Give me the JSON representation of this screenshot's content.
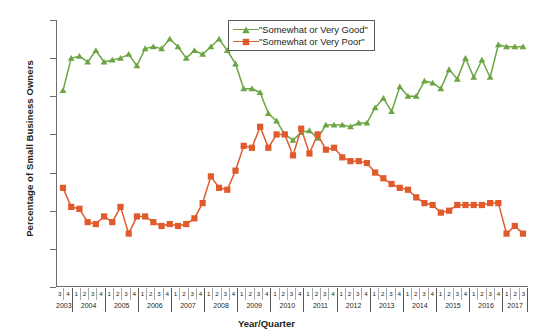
{
  "chart_data": {
    "type": "line",
    "title": "",
    "xlabel": "Year/Quarter",
    "ylabel": "Percentage of Small Business Owners",
    "ylim": [
      0,
      70
    ],
    "yticks": [
      0,
      10,
      20,
      30,
      40,
      50,
      60,
      70
    ],
    "ytick_labels": [
      "0%",
      "10%",
      "20%",
      "30%",
      "40%",
      "50%",
      "60%",
      "70%"
    ],
    "grid": false,
    "legend_position": "top-center",
    "x": [
      "2003 Q3",
      "2003 Q4",
      "2004 Q1",
      "2004 Q2",
      "2004 Q3",
      "2004 Q4",
      "2005 Q1",
      "2005 Q2",
      "2005 Q3",
      "2005 Q4",
      "2006 Q1",
      "2006 Q2",
      "2006 Q3",
      "2006 Q4",
      "2007 Q1",
      "2007 Q2",
      "2007 Q3",
      "2007 Q4",
      "2008 Q1",
      "2008 Q2",
      "2008 Q3",
      "2008 Q4",
      "2009 Q1",
      "2009 Q2",
      "2009 Q3",
      "2009 Q4",
      "2010 Q1",
      "2010 Q2",
      "2010 Q3",
      "2010 Q4",
      "2011 Q1",
      "2011 Q2",
      "2011 Q3",
      "2011 Q4",
      "2012 Q1",
      "2012 Q2",
      "2012 Q3",
      "2012 Q4",
      "2013 Q1",
      "2013 Q2",
      "2013 Q3",
      "2013 Q4",
      "2014 Q1",
      "2014 Q2",
      "2014 Q3",
      "2014 Q4",
      "2015 Q1",
      "2015 Q2",
      "2015 Q3",
      "2015 Q4",
      "2016 Q1",
      "2016 Q2",
      "2016 Q3",
      "2016 Q4",
      "2017 Q1",
      "2017 Q2",
      "2017 Q3"
    ],
    "years": [
      "2003",
      "2004",
      "2005",
      "2006",
      "2007",
      "2008",
      "2009",
      "2010",
      "2011",
      "2012",
      "2013",
      "2014",
      "2015",
      "2016",
      "2017"
    ],
    "quarters": [
      "3",
      "4",
      "1",
      "2",
      "3",
      "4",
      "1",
      "2",
      "3",
      "4",
      "1",
      "2",
      "3",
      "4",
      "1",
      "2",
      "3",
      "4",
      "1",
      "2",
      "3",
      "4",
      "1",
      "2",
      "3",
      "4",
      "1",
      "2",
      "3",
      "4",
      "1",
      "2",
      "3",
      "4",
      "1",
      "2",
      "3",
      "4",
      "1",
      "2",
      "3",
      "4",
      "1",
      "2",
      "3",
      "4",
      "1",
      "2",
      "3",
      "4",
      "1",
      "2",
      "3",
      "4",
      "1",
      "2",
      "3"
    ],
    "series": [
      {
        "name": "\"Somewhat or Very Good\"",
        "color": "#6DA544",
        "marker": "triangle",
        "values": [
          51.5,
          60,
          60.5,
          59,
          62,
          59,
          59.5,
          60,
          61,
          58,
          62.5,
          63,
          62.5,
          65,
          63,
          60,
          62,
          61,
          63,
          65,
          62,
          58.5,
          52,
          52,
          51,
          45.5,
          43.5,
          40,
          38.5,
          40.5,
          41,
          39,
          42.5,
          42.5,
          42.5,
          42,
          43,
          43,
          47,
          49.5,
          46,
          52.5,
          50,
          50,
          54,
          53.5,
          52,
          57,
          54.5,
          60,
          55,
          59.5,
          55,
          63.5,
          63,
          63,
          63
        ]
      },
      {
        "name": "\"Somewhat or Very Poor\"",
        "color": "#E05A2B",
        "marker": "square",
        "values": [
          26,
          21,
          20.5,
          17,
          16.5,
          18.5,
          17,
          21,
          14,
          18.5,
          18.5,
          17,
          16,
          16.5,
          16,
          16.5,
          18,
          22,
          29,
          26,
          25.5,
          30.5,
          37,
          36.5,
          42,
          36.5,
          40,
          40,
          34.5,
          41.5,
          35,
          40,
          36,
          36.5,
          34,
          33,
          33,
          32.5,
          30,
          28.5,
          27,
          26,
          25.5,
          23.5,
          22,
          21.5,
          19.5,
          20,
          21.5,
          21.5,
          21.5,
          21.5,
          22,
          22,
          14,
          16,
          14
        ]
      }
    ]
  },
  "axes": {
    "x_title": "Year/Quarter",
    "y_title": "Percentage of Small Business Owners"
  },
  "legend": {
    "items": [
      {
        "label": "\"Somewhat or Very Good\"",
        "color": "#6DA544"
      },
      {
        "label": "\"Somewhat or Very Poor\"",
        "color": "#E05A2B"
      }
    ]
  },
  "colors": {
    "good": "#6DA544",
    "poor": "#E05A2B",
    "axis": "#6d6e71",
    "text": "#231f20"
  }
}
